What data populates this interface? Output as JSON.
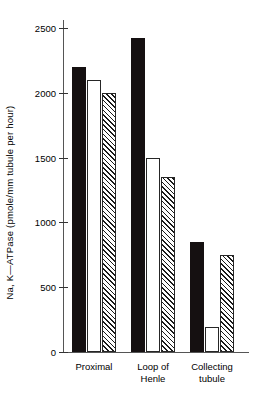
{
  "chart_data": {
    "type": "bar",
    "title": "",
    "xlabel": "",
    "ylabel": "Na, K—ATPase (pmole/mm tubule per hour)",
    "ylim": [
      0,
      2500
    ],
    "yticks": [
      0,
      500,
      1000,
      1500,
      2000,
      2500
    ],
    "ytick_labels": [
      "0",
      "500",
      "1000",
      "1500",
      "2000",
      "2500"
    ],
    "grid": false,
    "legend": "none",
    "categories": [
      "Proximal",
      "Loop of\nHenle",
      "Collecting\ntubule"
    ],
    "series": [
      {
        "name": "solid",
        "fill": "solid-black",
        "values": [
          2200,
          2420,
          850
        ]
      },
      {
        "name": "open",
        "fill": "open-white",
        "values": [
          2100,
          1500,
          190
        ]
      },
      {
        "name": "hatched",
        "fill": "diagonal-hatch",
        "values": [
          2000,
          1350,
          750
        ]
      }
    ],
    "colors": {
      "solid": "#151011",
      "open": "#ffffff",
      "hatch_line": "#1a1a1a",
      "axis": "#555555",
      "background": "#ffffff"
    }
  }
}
